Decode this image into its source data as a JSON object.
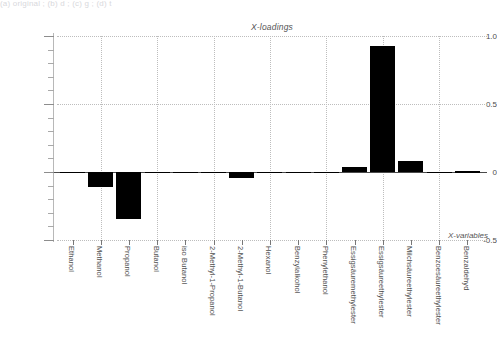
{
  "top_clipped_text": "(a)   original  ;   (b)   d  ;   (c)   g  ;   (d)   t",
  "chart_data": {
    "type": "bar",
    "title": "X-loadings",
    "xlabel": "X-variables",
    "ylabel": "",
    "ylim": [
      -0.5,
      1.05
    ],
    "grid": true,
    "legend": "none",
    "yticks": [
      "1.0",
      "0.5",
      "0",
      "-0.5"
    ],
    "ytick_values": [
      1.0,
      0.5,
      0,
      -0.5
    ],
    "categories": [
      "Ethanol",
      "Methanol",
      "Propanol",
      "Butanol",
      "iso Butanol",
      "2-Methyl-1-Propanol",
      "2-Methyl-1-Butanol",
      "Hexanol",
      "Benzylalkohol",
      "Phenylethanol",
      "Essigsäuremethylester",
      "Essigsäureethylester",
      "Milchsäureethylester",
      "Benzoesäureethylester",
      "Benzaldehyd"
    ],
    "values": [
      -0.005,
      -0.11,
      -0.345,
      -0.005,
      -0.004,
      -0.006,
      -0.045,
      -0.004,
      -0.004,
      -0.005,
      0.035,
      0.93,
      0.08,
      -0.004,
      0.004
    ],
    "bar_color": "#000000"
  }
}
